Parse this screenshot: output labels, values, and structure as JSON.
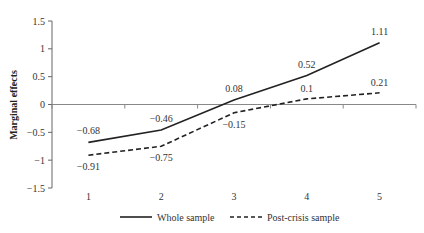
{
  "chart_data": {
    "type": "line",
    "title": "",
    "xlabel": "",
    "ylabel": "Marginal effects",
    "categories": [
      "1",
      "2",
      "3",
      "4",
      "5"
    ],
    "ylim": [
      -1.5,
      1.5
    ],
    "yticks": [
      -1.5,
      -1,
      -0.5,
      0,
      0.5,
      1,
      1.5
    ],
    "ytick_labels": [
      "−1.5",
      "−1",
      "−0.5",
      "0",
      "0.5",
      "1",
      "1.5"
    ],
    "grid": false,
    "legend_position": "bottom",
    "series": [
      {
        "name": "Whole sample",
        "style": "solid",
        "color": "#222222",
        "values": [
          -0.68,
          -0.46,
          0.08,
          0.52,
          1.11
        ],
        "labels": [
          "−0.68",
          "−0.46",
          "0.08",
          "0.52",
          "1.11"
        ]
      },
      {
        "name": "Post-crisis sample",
        "style": "dashed",
        "color": "#222222",
        "values": [
          -0.91,
          -0.75,
          -0.15,
          0.1,
          0.21
        ],
        "labels": [
          "−0.91",
          "−0.75",
          "−0.15",
          "0.1",
          "0.21"
        ]
      }
    ]
  }
}
